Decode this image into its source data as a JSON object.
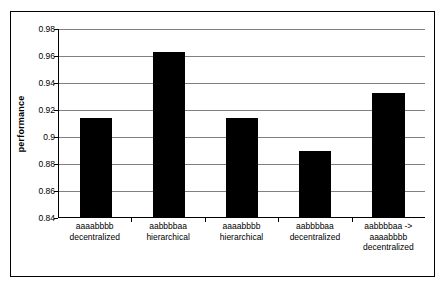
{
  "chart_data": {
    "type": "bar",
    "title": "",
    "xlabel": "",
    "ylabel": "performance",
    "ylim": [
      0.84,
      0.98
    ],
    "ytick_step": 0.02,
    "yticks": [
      "0.98",
      "0.96",
      "0.94",
      "0.92",
      "0.9",
      "0.88",
      "0.86",
      "0.84"
    ],
    "grid": true,
    "legend": "none",
    "bar_color": "#000000",
    "categories": [
      "aaaabbbb decentralized",
      "aabbbbaa hierarchical",
      "aaaabbbb hierarchical",
      "aabbbbaa decentralized",
      "aabbbbaa -> aaaabbbb decentralized"
    ],
    "category_lines": [
      [
        "aaaabbbb",
        "decentralized"
      ],
      [
        "aabbbbaa",
        "hierarchical"
      ],
      [
        "aaaabbbb",
        "hierarchical"
      ],
      [
        "aabbbbaa",
        "decentralized"
      ],
      [
        "aabbbbaa ->",
        "aaaabbbb",
        "decentralized"
      ]
    ],
    "values": [
      0.913,
      0.962,
      0.913,
      0.889,
      0.932
    ]
  }
}
